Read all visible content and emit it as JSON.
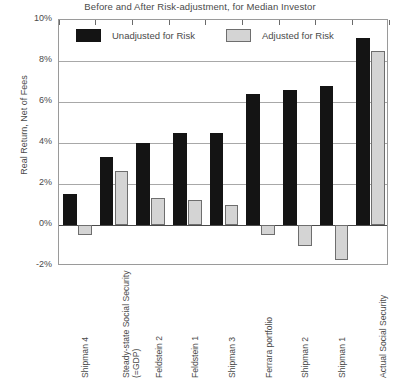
{
  "chart_data": {
    "type": "bar",
    "title": "Before and After Risk-adjustment, for Median Investor",
    "xlabel": "",
    "ylabel": "Real Return, Net of Fees",
    "ylim": [
      -2,
      10
    ],
    "ytick_labels": [
      "10%",
      "8%",
      "6%",
      "4%",
      "2%",
      "0%",
      "-2%"
    ],
    "ytick_values": [
      10,
      8,
      6,
      4,
      2,
      0,
      -2
    ],
    "grid": true,
    "legend_position": "top-inside",
    "categories": [
      "Shipman 4",
      "Steady-state Social Security (=GDP)",
      "Feldstein 2",
      "Feldstein 1",
      "Shipman 3",
      "Ferrara portfolio",
      "Shipman 2",
      "Shipman 1",
      "Actual Social Security"
    ],
    "series": [
      {
        "name": "Unadjusted for Risk",
        "color": "#141414",
        "values": [
          1.5,
          3.3,
          4.0,
          4.5,
          4.5,
          6.4,
          6.6,
          6.8,
          9.1
        ]
      },
      {
        "name": "Adjusted for Risk",
        "color": "#d4d4d4",
        "values": [
          -0.5,
          2.65,
          1.3,
          1.2,
          1.0,
          -0.5,
          -1.0,
          -1.7,
          8.5
        ]
      }
    ]
  },
  "legend": {
    "unadjusted_label": "Unadjusted for Risk",
    "adjusted_label": "Adjusted for Risk"
  }
}
